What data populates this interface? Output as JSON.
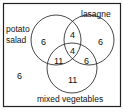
{
  "diagram": {
    "type": "venn",
    "sets": [
      {
        "label_lines": [
          "potato",
          "salad"
        ],
        "only": "6"
      },
      {
        "label_lines": [
          "lasagne"
        ],
        "only": "6"
      },
      {
        "label_lines": [
          "mixed vegetables"
        ],
        "only": "11"
      }
    ],
    "regions": {
      "potato_only": "6",
      "lasagne_only": "6",
      "mixed_only": "11",
      "potato_lasagne": "4",
      "potato_mixed": "11",
      "lasagne_mixed": "6",
      "all_three": "4",
      "none": "6"
    },
    "labels": {
      "potato": "potato",
      "salad": "salad",
      "lasagne": "lasagne",
      "mixed": "mixed vegetables"
    }
  }
}
